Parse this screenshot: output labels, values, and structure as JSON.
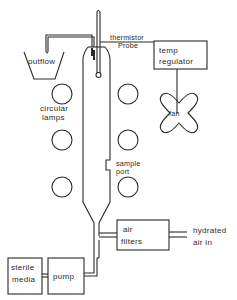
{
  "diagram": {
    "type": "apparatus-schematic",
    "labels": {
      "outflow": "outflow",
      "thermistor_line1": "thermistor",
      "thermistor_line2": "Probe",
      "temp_regulator_line1": "temp",
      "temp_regulator_line2": "regulator",
      "fan": "fan",
      "circular_lamps_line1": "circular",
      "circular_lamps_line2": "lamps",
      "sample_port_line1": "sample",
      "sample_port_line2": "port",
      "air_filters_line1": "air",
      "air_filters_line2": "filters",
      "hydrated_air_line1": "hydrated",
      "hydrated_air_line2": "air in",
      "sterile_media_line1": "sterile",
      "sterile_media_line2": "media",
      "pump": "pump"
    },
    "components": [
      {
        "id": "outflow-vessel",
        "label": "outflow"
      },
      {
        "id": "thermistor-probe",
        "label": "thermistor Probe"
      },
      {
        "id": "temp-regulator",
        "label": "temp regulator"
      },
      {
        "id": "fan",
        "label": "fan"
      },
      {
        "id": "circular-lamps",
        "label": "circular lamps",
        "count": 6
      },
      {
        "id": "culture-column",
        "label": ""
      },
      {
        "id": "sample-port",
        "label": "sample port"
      },
      {
        "id": "air-filters",
        "label": "air filters"
      },
      {
        "id": "hydrated-air-inlet",
        "label": "hydrated air in"
      },
      {
        "id": "sterile-media",
        "label": "sterile media"
      },
      {
        "id": "pump",
        "label": "pump"
      }
    ],
    "connections": [
      {
        "from": "culture-column",
        "to": "outflow-vessel"
      },
      {
        "from": "thermistor-probe",
        "to": "temp-regulator"
      },
      {
        "from": "temp-regulator",
        "to": "fan"
      },
      {
        "from": "hydrated-air-inlet",
        "to": "air-filters"
      },
      {
        "from": "air-filters",
        "to": "culture-column"
      },
      {
        "from": "sterile-media",
        "to": "pump"
      },
      {
        "from": "pump",
        "to": "culture-column"
      }
    ]
  }
}
